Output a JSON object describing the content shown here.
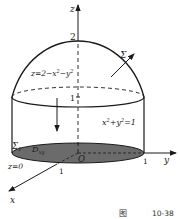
{
  "figure": {
    "caption_prefix": "图",
    "caption_number": "10-38"
  },
  "axes": {
    "z_label": "z",
    "y_label": "y",
    "x_label": "x",
    "origin_label": "O"
  },
  "ticks": {
    "z_top": "2",
    "z_one": "1",
    "y_one": "1",
    "x_one": "1"
  },
  "surfaces": {
    "paraboloid_eq": "z=2−x²−y²",
    "cylinder_eq": "x²+y²=1",
    "sigma": "Σ",
    "sigma1": "Σ",
    "sigma1_sub": "1",
    "plane_eq": "z=0",
    "region": "D",
    "region_sub": "xy"
  },
  "colors": {
    "stroke": "#1a1a1a",
    "region_fill": "#6b6b6b"
  }
}
